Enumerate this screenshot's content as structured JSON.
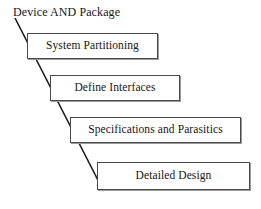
{
  "diagram": {
    "type": "flow-sequence",
    "heading": "Device AND Package",
    "arrow": {
      "name": "downward-progression-arrow",
      "start_x": 15,
      "start_y": 18,
      "end_x": 106,
      "end_y": 193,
      "color": "#1a1a1a"
    },
    "stages": [
      {
        "label": "System Partitioning"
      },
      {
        "label": "Define Interfaces"
      },
      {
        "label": "Specifications and Parasitics"
      },
      {
        "label": "Detailed Design"
      }
    ],
    "colors": {
      "box_border": "#4a4a4a",
      "box_fill": "#ffffff",
      "text": "#151515",
      "shadow": "#9a9a9a",
      "background": "#ffffff"
    }
  }
}
